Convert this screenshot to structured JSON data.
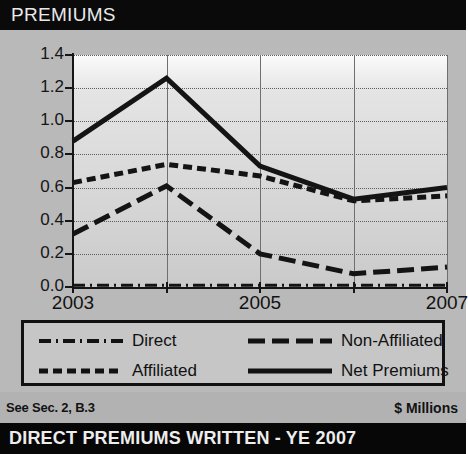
{
  "header": {
    "title": "PREMIUMS"
  },
  "footer": {
    "note_left": "See Sec. 2, B.3",
    "note_right": "$ Millions",
    "banner_title": "DIRECT PREMIUMS WRITTEN - YE 2007"
  },
  "legend": {
    "items": [
      {
        "label": "Direct",
        "style": "dash-dot"
      },
      {
        "label": "Non-Affiliated",
        "style": "long-dash"
      },
      {
        "label": "Affiliated",
        "style": "short-dash"
      },
      {
        "label": "Net Premiums",
        "style": "solid"
      }
    ]
  },
  "chart_data": {
    "type": "line",
    "title": "PREMIUMS",
    "xlabel": "",
    "ylabel": "$ Millions",
    "x": [
      2003,
      2004,
      2005,
      2006,
      2007
    ],
    "xtick_labels": [
      "2003",
      "",
      "2005",
      "",
      "2007"
    ],
    "ytick_labels": [
      "0.0",
      "0.2",
      "0.4",
      "0.6",
      "0.8",
      "1.0",
      "1.2",
      "1.4"
    ],
    "ylim": [
      0.0,
      1.4
    ],
    "ytick_step": 0.2,
    "grid": true,
    "legend_position": "below",
    "series": [
      {
        "name": "Net Premiums",
        "style": "solid",
        "values": [
          0.88,
          1.26,
          0.73,
          0.53,
          0.6
        ]
      },
      {
        "name": "Affiliated",
        "style": "short-dash",
        "values": [
          0.63,
          0.74,
          0.67,
          0.52,
          0.55
        ]
      },
      {
        "name": "Non-Affiliated",
        "style": "long-dash",
        "values": [
          0.32,
          0.61,
          0.2,
          0.08,
          0.12
        ]
      },
      {
        "name": "Direct",
        "style": "dash-dot",
        "values": [
          0.01,
          0.01,
          0.01,
          0.01,
          0.01
        ]
      }
    ]
  }
}
